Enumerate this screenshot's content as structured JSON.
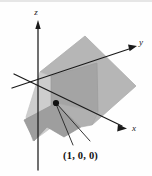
{
  "figure": {
    "kind": "3d-coordinate-plane-diagram",
    "background_color": "#fefefe",
    "axes": {
      "z": {
        "label": "z",
        "label_x": 36,
        "label_y": 15
      },
      "y": {
        "label": "y",
        "label_x": 141,
        "label_y": 45
      },
      "x": {
        "label": "x",
        "label_y": 131,
        "label_x": 133
      }
    },
    "point": {
      "label": "(1, 0, 0)",
      "label_x": 63,
      "label_y": 158,
      "marker_x": 56,
      "marker_y": 103,
      "marker_color": "#111111",
      "marker_radius": 3.1
    },
    "surfaces": [
      {
        "name": "main-slanted-plane",
        "fill": "#b6b6b6",
        "stroke": "#a8a8a8",
        "points": "40,72 85,36 136,86 92,125"
      },
      {
        "name": "vertical-plane-front",
        "fill": "#a3a3a3",
        "stroke": "#9a9a9a",
        "points": "50,76 96,63 97,112 50,126"
      },
      {
        "name": "lower-left-wedge",
        "fill": "#9d9d9d",
        "stroke": "#949494",
        "points": "22,122 56,103 80,128 63,138 46,128 33,140"
      },
      {
        "name": "pale-left-sliver",
        "fill": "#cfcfcf",
        "stroke": "#c6c6c6",
        "points": "40,72 50,76 50,126 33,140 26,118"
      }
    ],
    "colors": {
      "axis": "#1a1a1a",
      "plane_light": "#b6b6b6",
      "plane_dark": "#a3a3a3",
      "plane_pale": "#cfcfcf",
      "label_text": "#111111",
      "leader_line": "#2a2a2a"
    },
    "top_edge_band_color": "#cdcdcd"
  }
}
